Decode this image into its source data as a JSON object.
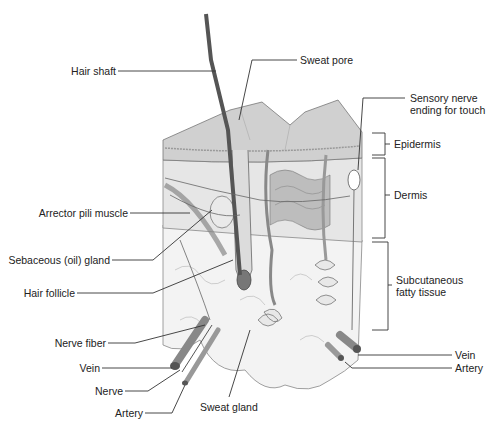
{
  "diagram": {
    "labels": {
      "hair_shaft": "Hair shaft",
      "sweat_pore": "Sweat pore",
      "sensory_nerve_1": "Sensory nerve",
      "sensory_nerve_2": "ending for touch",
      "epidermis": "Epidermis",
      "dermis": "Dermis",
      "subcutaneous_1": "Subcutaneous",
      "subcutaneous_2": "fatty tissue",
      "arrector_pili": "Arrector pili muscle",
      "sebaceous_gland": "Sebaceous (oil) gland",
      "hair_follicle": "Hair follicle",
      "nerve_fiber": "Nerve fiber",
      "vein_left": "Vein",
      "nerve": "Nerve",
      "artery_left": "Artery",
      "sweat_gland": "Sweat gland",
      "vein_right": "Vein",
      "artery_right": "Artery"
    },
    "colors": {
      "line": "#333333",
      "skin_surface": "#c8c8c8",
      "dermis": "#e4e4e4",
      "fat": "#f2f2f2",
      "hair": "#555555"
    }
  }
}
